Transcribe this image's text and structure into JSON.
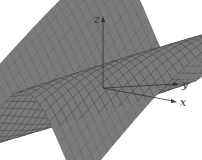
{
  "figure": {
    "type": "3d-surface",
    "surface_color": "#7a7a7a",
    "mesh_color": "#3a3a3a",
    "axes": {
      "x": {
        "label": "x"
      },
      "y": {
        "label": "y"
      },
      "z": {
        "label": "z"
      }
    }
  },
  "chart_data": {
    "type": "surface",
    "title": "",
    "xlabel": "x",
    "ylabel": "y",
    "zlabel": "z",
    "grid": false
  }
}
